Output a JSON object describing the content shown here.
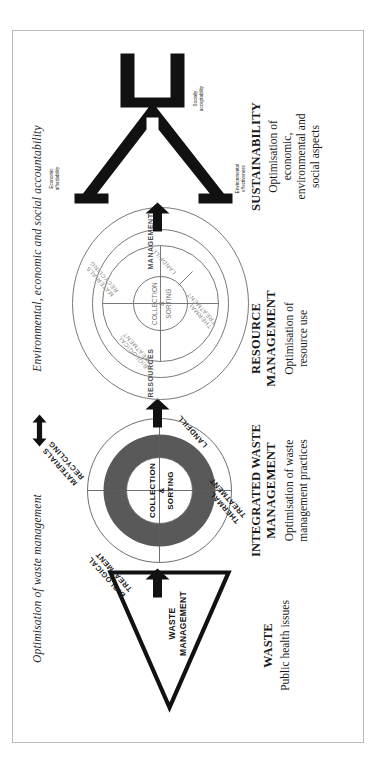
{
  "figure": {
    "header": {
      "left_label": "Optimisation of waste management",
      "right_label": "Environmental, economic and social accountability",
      "arrow_icon": "double-headed-horizontal-arrow"
    },
    "stages": [
      {
        "id": "waste",
        "title": "WASTE",
        "subtitle": "Public health issues",
        "symbol": "triangle",
        "symbol_label": "WASTE\nMANAGEMENT",
        "symbol_label_line1": "WASTE",
        "symbol_label_line2": "MANAGEMENT"
      },
      {
        "id": "integrated-waste-management",
        "title_line1": "INTEGRATED WASTE",
        "title_line2": "MANAGEMENT",
        "subtitle_line1": "Optimisation of waste",
        "subtitle_line2": "management practices",
        "symbol": "segmented-circle",
        "hub_line1": "COLLECTION",
        "hub_line2": "&",
        "hub_line3": "SORTING",
        "segments": [
          {
            "line1": "MATERIALS",
            "line2": "RECYCLING"
          },
          {
            "line1": "LANDFILL",
            "line2": ""
          },
          {
            "line1": "THERMAL",
            "line2": "TREATMENT"
          },
          {
            "line1": "BIOLOGICAL",
            "line2": "TREATMENT"
          }
        ]
      },
      {
        "id": "resource-management",
        "title_line1": "RESOURCE",
        "title_line2": "MANAGEMENT",
        "subtitle_line1": "Optimisation of",
        "subtitle_line2": "resource use",
        "symbol": "segmented-circle-with-outer-ring",
        "outer_ring_left": "RESOURCES",
        "outer_ring_right": "MANAGEMENT",
        "hub_line1": "COLLECTION",
        "hub_line2": "&",
        "hub_line3": "SORTING",
        "segments": [
          {
            "line1": "MATERIALS",
            "line2": "RECYCLING"
          },
          {
            "line1": "LANDFILL",
            "line2": ""
          },
          {
            "line1": "THERMAL",
            "line2": "TREATMENT"
          },
          {
            "line1": "BIOLOGICAL",
            "line2": "TREATMENT"
          }
        ]
      },
      {
        "id": "sustainability",
        "title": "SUSTAINABILITY",
        "subtitle_line1": "Optimisation of",
        "subtitle_line2": "economic,",
        "subtitle_line3": "environmental and",
        "subtitle_line4": "social aspects",
        "symbol": "three-pronged-fork",
        "prongs": [
          {
            "line1": "Environmental",
            "line2": "effectiveness"
          },
          {
            "line1": "Socially",
            "line2": "acceptability"
          },
          {
            "line1": "Economic",
            "line2": "affordability"
          }
        ]
      }
    ],
    "connectors": [
      {
        "name": "arrow-waste-to-iwm",
        "icon": "block-arrow-right"
      },
      {
        "name": "arrow-iwm-to-rm",
        "icon": "block-arrow-right"
      },
      {
        "name": "arrow-rm-to-sustainability",
        "icon": "block-arrow-right"
      }
    ],
    "colors": {
      "ink": "#1a1a1a",
      "segment_fill": "#595959",
      "page_border": "#b9b9b9",
      "paper": "#ffffff"
    }
  }
}
